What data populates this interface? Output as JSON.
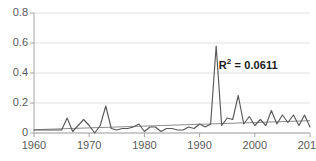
{
  "chart_data": {
    "type": "line",
    "title": "",
    "xlabel": "",
    "ylabel": "",
    "xlim": [
      1960,
      2010
    ],
    "ylim": [
      0,
      0.8
    ],
    "grid": true,
    "gridlines_y": [
      0,
      0.2,
      0.4,
      0.6,
      0.8
    ],
    "legend": "none",
    "y_ticks": [
      "0",
      "0.2",
      "0.4",
      "0.6",
      "0.8"
    ],
    "y_tick_values": [
      0,
      0.2,
      0.4,
      0.6,
      0.8
    ],
    "x_ticks": [
      "1960",
      "1970",
      "1980",
      "1990",
      "2000",
      "2010"
    ],
    "x_tick_values": [
      1960,
      1970,
      1980,
      1990,
      2000,
      2010
    ],
    "annotations": [
      {
        "name": "r-squared",
        "text": "R² = 0.0611",
        "value": 0.0611,
        "x": 1998,
        "y": 0.47
      }
    ],
    "series": [
      {
        "name": "data-series",
        "type": "line",
        "color": "#595959",
        "x": [
          1960,
          1961,
          1962,
          1963,
          1964,
          1965,
          1966,
          1967,
          1968,
          1969,
          1970,
          1971,
          1972,
          1973,
          1974,
          1975,
          1976,
          1977,
          1978,
          1979,
          1980,
          1981,
          1982,
          1983,
          1984,
          1985,
          1986,
          1987,
          1988,
          1989,
          1990,
          1991,
          1992,
          1993,
          1994,
          1995,
          1996,
          1997,
          1998,
          1999,
          2000,
          2001,
          2002,
          2003,
          2004,
          2005,
          2006,
          2007,
          2008,
          2009,
          2010
        ],
        "values": [
          0.02,
          0.02,
          0.02,
          0.02,
          0.02,
          0.02,
          0.1,
          0.01,
          0.05,
          0.09,
          0.05,
          0.0,
          0.05,
          0.18,
          0.03,
          0.02,
          0.03,
          0.03,
          0.04,
          0.06,
          0.01,
          0.04,
          0.04,
          0.01,
          0.03,
          0.03,
          0.02,
          0.02,
          0.04,
          0.03,
          0.06,
          0.04,
          0.06,
          0.58,
          0.05,
          0.1,
          0.09,
          0.25,
          0.06,
          0.11,
          0.05,
          0.09,
          0.05,
          0.15,
          0.06,
          0.12,
          0.07,
          0.12,
          0.05,
          0.12,
          0.04
        ]
      },
      {
        "name": "linear-trendline",
        "type": "line",
        "color": "#808080",
        "x": [
          1960,
          2010
        ],
        "values": [
          0.022,
          0.082
        ]
      }
    ]
  },
  "axes": {
    "y_axis_name": "y-axis",
    "x_axis_name": "x-axis"
  },
  "colors": {
    "series": "#595959",
    "trendline": "#808080",
    "grid": "#d9d9d9",
    "axis": "#a6a6a6",
    "tick_text": "#595959",
    "annotation_text": "#1a1a1a",
    "background": "#ffffff"
  }
}
